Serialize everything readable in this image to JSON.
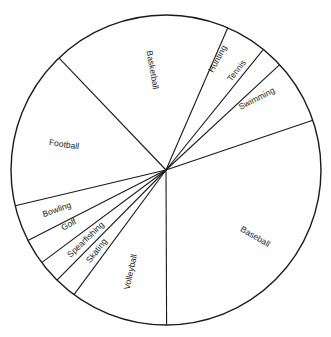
{
  "chart_data": {
    "type": "pie",
    "title": "",
    "start_angle_deg": 316.3,
    "direction": "clockwise",
    "legend": "none (labels drawn inside slices)",
    "colors": {
      "fill": "#ffffff",
      "stroke": "#1a1a1a",
      "text": "#222222"
    },
    "categories": [
      "Basketball",
      "Hunting",
      "Tennis",
      "Swimming",
      "Baseball",
      "Volleyball",
      "Skating",
      "Spearfishing",
      "Golf",
      "Bowling",
      "Football"
    ],
    "values": [
      18.7,
      4.3,
      2.3,
      6.7,
      30.2,
      10.2,
      2.3,
      2.4,
      2.7,
      3.8,
      16.6
    ],
    "slices": [
      {
        "label": "Basketball",
        "value": 18.7,
        "label_pos": [
          152,
          70
        ],
        "label_rot": 80
      },
      {
        "label": "Hunting",
        "value": 4.3,
        "label_pos": [
          218,
          59
        ],
        "label_rot": -62
      },
      {
        "label": "Tennis",
        "value": 2.3,
        "label_pos": [
          237,
          71
        ],
        "label_rot": -52
      },
      {
        "label": "Swimming",
        "value": 6.7,
        "label_pos": [
          257,
          99
        ],
        "label_rot": -27
      },
      {
        "label": "Baseball",
        "value": 30.2,
        "label_pos": [
          255,
          237
        ],
        "label_rot": 30
      },
      {
        "label": "Volleyball",
        "value": 10.2,
        "label_pos": [
          131,
          272
        ],
        "label_rot": -78
      },
      {
        "label": "Skating",
        "value": 2.3,
        "label_pos": [
          97,
          251
        ],
        "label_rot": -52
      },
      {
        "label": "Spearfishing",
        "value": 2.4,
        "label_pos": [
          86,
          240
        ],
        "label_rot": -44
      },
      {
        "label": "Golf",
        "value": 2.7,
        "label_pos": [
          69,
          225
        ],
        "label_rot": -30
      },
      {
        "label": "Bowling",
        "value": 3.8,
        "label_pos": [
          57,
          210
        ],
        "label_rot": -20
      },
      {
        "label": "Football",
        "value": 16.6,
        "label_pos": [
          64,
          145
        ],
        "label_rot": 8
      }
    ],
    "geometry": {
      "cx": 166,
      "cy": 170,
      "r": 155
    }
  }
}
